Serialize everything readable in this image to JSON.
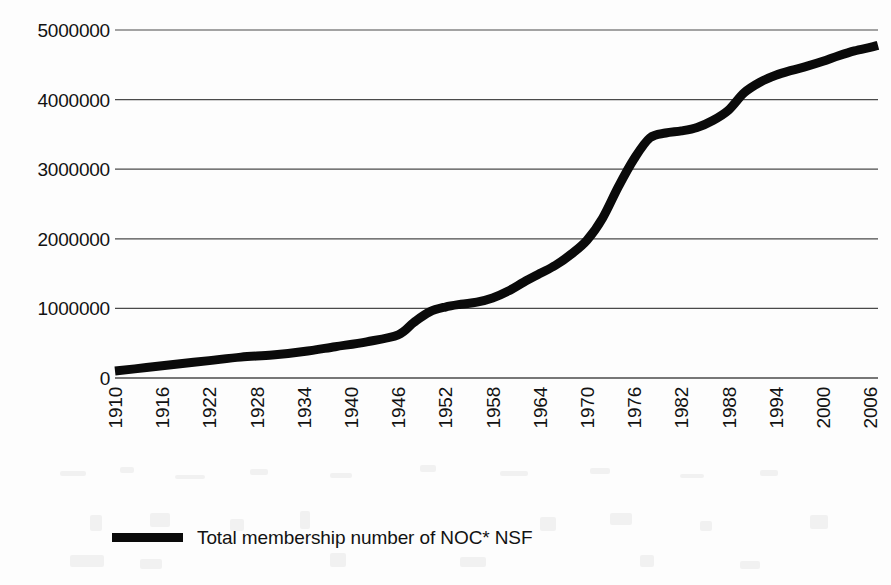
{
  "chart_data": {
    "type": "line",
    "title": "",
    "subtitle": "",
    "xlabel": "",
    "ylabel": "",
    "xlim": [
      1910,
      2007
    ],
    "ylim": [
      0,
      5000000
    ],
    "grid": true,
    "grid_axis": "y",
    "legend_position": "bottom-left",
    "line_color": "#0a0a0a",
    "line_width": 9,
    "background_color": "#fdfdfd",
    "text_color": "#121212",
    "y_tick_labels": [
      "5000000",
      "4000000",
      "3000000",
      "2000000",
      "1000000",
      "0"
    ],
    "y_tick_values": [
      5000000,
      4000000,
      3000000,
      2000000,
      1000000,
      0
    ],
    "x_tick_labels": [
      "1910",
      "1916",
      "1922",
      "1928",
      "1934",
      "1940",
      "1946",
      "1952",
      "1958",
      "1964",
      "1970",
      "1976",
      "1982",
      "1988",
      "1994",
      "2000",
      "2006"
    ],
    "x_tick_values": [
      1910,
      1916,
      1922,
      1928,
      1934,
      1940,
      1946,
      1952,
      1958,
      1964,
      1970,
      1976,
      1982,
      1988,
      1994,
      2000,
      2006
    ],
    "series": [
      {
        "name": "Total membership number of NOC* NSF",
        "color": "#0a0a0a",
        "x": [
          1910,
          1914,
          1918,
          1922,
          1926,
          1930,
          1934,
          1938,
          1942,
          1946,
          1948,
          1950,
          1952,
          1954,
          1956,
          1958,
          1960,
          1962,
          1964,
          1966,
          1968,
          1970,
          1972,
          1974,
          1976,
          1978,
          1980,
          1982,
          1984,
          1986,
          1988,
          1990,
          1992,
          1994,
          1996,
          1998,
          2000,
          2002,
          2004,
          2006,
          2007
        ],
        "values": [
          100000,
          150000,
          200000,
          250000,
          300000,
          330000,
          380000,
          450000,
          520000,
          620000,
          800000,
          950000,
          1020000,
          1060000,
          1090000,
          1150000,
          1250000,
          1380000,
          1500000,
          1620000,
          1780000,
          1980000,
          2300000,
          2750000,
          3150000,
          3450000,
          3520000,
          3550000,
          3600000,
          3700000,
          3850000,
          4100000,
          4250000,
          4350000,
          4420000,
          4480000,
          4550000,
          4630000,
          4700000,
          4750000,
          4780000
        ]
      }
    ],
    "annotations": []
  },
  "legend": {
    "items": [
      {
        "label": "Total membership number of NOC* NSF",
        "color": "#0a0a0a"
      }
    ]
  }
}
